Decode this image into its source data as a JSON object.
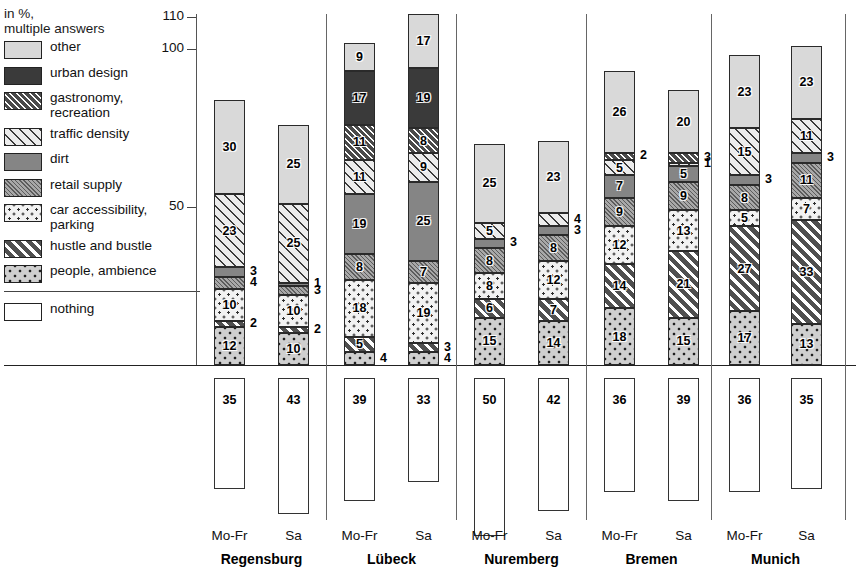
{
  "legend": {
    "title_line1": "in %,",
    "title_line2": "multiple answers",
    "items": [
      {
        "key": "other",
        "label": "other",
        "pattern": "p-other"
      },
      {
        "key": "urban",
        "label": "urban design",
        "pattern": "p-urban"
      },
      {
        "key": "gastro",
        "label": "gastronomy,\nrecreation",
        "pattern": "p-gastro"
      },
      {
        "key": "traffic",
        "label": "traffic density",
        "pattern": "p-traffic"
      },
      {
        "key": "dirt",
        "label": "dirt",
        "pattern": "p-dirt"
      },
      {
        "key": "retail",
        "label": "retail supply",
        "pattern": "p-retail"
      },
      {
        "key": "car",
        "label": "car accessibility,\nparking",
        "pattern": "p-car"
      },
      {
        "key": "hustle",
        "label": "hustle and bustle",
        "pattern": "p-hustle"
      },
      {
        "key": "people",
        "label": "people, ambience",
        "pattern": "p-people"
      }
    ],
    "nothing_label": "nothing",
    "nothing_pattern": "p-nothing"
  },
  "axis": {
    "ticks": [
      110,
      100,
      50
    ],
    "tick_labels": [
      "110",
      "100",
      "50"
    ]
  },
  "chart_data": {
    "type": "bar",
    "title": "",
    "subtitle": "in %, multiple answers",
    "xlabel": "",
    "ylabel": "in %",
    "ylim": [
      0,
      110
    ],
    "grid": false,
    "legend_position": "left",
    "stacked": true,
    "categories": [
      "Regensburg Mo-Fr",
      "Regensburg Sa",
      "Lübeck Mo-Fr",
      "Lübeck Sa",
      "Nuremberg Mo-Fr",
      "Nuremberg Sa",
      "Bremen Mo-Fr",
      "Bremen Sa",
      "Munich Mo-Fr",
      "Munich Sa"
    ],
    "series": [
      {
        "name": "people, ambience",
        "values": [
          12,
          10,
          4,
          4,
          15,
          14,
          18,
          15,
          17,
          13
        ]
      },
      {
        "name": "hustle and bustle",
        "values": [
          2,
          2,
          5,
          3,
          6,
          7,
          14,
          21,
          27,
          33
        ]
      },
      {
        "name": "car accessibility, parking",
        "values": [
          10,
          10,
          18,
          19,
          8,
          12,
          12,
          13,
          5,
          7
        ]
      },
      {
        "name": "retail supply",
        "values": [
          4,
          3,
          8,
          7,
          8,
          8,
          9,
          9,
          8,
          11
        ]
      },
      {
        "name": "dirt",
        "values": [
          3,
          1,
          19,
          25,
          3,
          3,
          7,
          5,
          3,
          3
        ]
      },
      {
        "name": "traffic density",
        "values": [
          23,
          25,
          11,
          9,
          5,
          4,
          5,
          1,
          15,
          11
        ]
      },
      {
        "name": "gastronomy, recreation",
        "values": [
          0,
          0,
          11,
          8,
          0,
          0,
          2,
          3,
          0,
          0
        ]
      },
      {
        "name": "urban design",
        "values": [
          0,
          0,
          17,
          19,
          0,
          0,
          0,
          0,
          0,
          0
        ]
      },
      {
        "name": "other",
        "values": [
          30,
          25,
          9,
          17,
          25,
          23,
          26,
          20,
          23,
          23
        ]
      }
    ],
    "nothing": {
      "name": "nothing",
      "values": [
        35,
        43,
        39,
        33,
        50,
        42,
        36,
        39,
        36,
        35
      ]
    }
  },
  "groups": [
    {
      "name": "Regensburg",
      "bars": [
        {
          "day": "Mo-Fr",
          "nothing": 35,
          "segments": [
            {
              "key": "people",
              "value": 12,
              "inside": true
            },
            {
              "key": "hustle",
              "value": 2,
              "inside": false
            },
            {
              "key": "car",
              "value": 10,
              "inside": true
            },
            {
              "key": "retail",
              "value": 4,
              "inside": false
            },
            {
              "key": "dirt",
              "value": 3,
              "inside": false
            },
            {
              "key": "traffic",
              "value": 23,
              "inside": true
            },
            {
              "key": "other",
              "value": 30,
              "inside": true
            }
          ]
        },
        {
          "day": "Sa",
          "nothing": 43,
          "segments": [
            {
              "key": "people",
              "value": 10,
              "inside": true
            },
            {
              "key": "hustle",
              "value": 2,
              "inside": false
            },
            {
              "key": "car",
              "value": 10,
              "inside": true
            },
            {
              "key": "retail",
              "value": 3,
              "inside": false
            },
            {
              "key": "dirt",
              "value": 1,
              "inside": false
            },
            {
              "key": "traffic",
              "value": 25,
              "inside": true
            },
            {
              "key": "other",
              "value": 25,
              "inside": true
            }
          ]
        }
      ]
    },
    {
      "name": "Lübeck",
      "bars": [
        {
          "day": "Mo-Fr",
          "nothing": 39,
          "segments": [
            {
              "key": "people",
              "value": 4,
              "inside": false
            },
            {
              "key": "hustle",
              "value": 5,
              "inside": true
            },
            {
              "key": "car",
              "value": 18,
              "inside": true
            },
            {
              "key": "retail",
              "value": 8,
              "inside": true
            },
            {
              "key": "dirt",
              "value": 19,
              "inside": true
            },
            {
              "key": "traffic",
              "value": 11,
              "inside": true
            },
            {
              "key": "gastro",
              "value": 11,
              "inside": true
            },
            {
              "key": "urban",
              "value": 17,
              "inside": true
            },
            {
              "key": "other",
              "value": 9,
              "inside": true
            }
          ]
        },
        {
          "day": "Sa",
          "nothing": 33,
          "segments": [
            {
              "key": "people",
              "value": 4,
              "inside": false
            },
            {
              "key": "hustle",
              "value": 3,
              "inside": false
            },
            {
              "key": "car",
              "value": 19,
              "inside": true
            },
            {
              "key": "retail",
              "value": 7,
              "inside": true
            },
            {
              "key": "dirt",
              "value": 25,
              "inside": true
            },
            {
              "key": "traffic",
              "value": 9,
              "inside": true
            },
            {
              "key": "gastro",
              "value": 8,
              "inside": true
            },
            {
              "key": "urban",
              "value": 19,
              "inside": true
            },
            {
              "key": "other",
              "value": 17,
              "inside": true
            }
          ]
        }
      ]
    },
    {
      "name": "Nuremberg",
      "bars": [
        {
          "day": "Mo-Fr",
          "nothing": 50,
          "segments": [
            {
              "key": "people",
              "value": 15,
              "inside": true
            },
            {
              "key": "hustle",
              "value": 6,
              "inside": true
            },
            {
              "key": "car",
              "value": 8,
              "inside": true
            },
            {
              "key": "retail",
              "value": 8,
              "inside": true
            },
            {
              "key": "dirt",
              "value": 3,
              "inside": false
            },
            {
              "key": "traffic",
              "value": 5,
              "inside": true
            },
            {
              "key": "other",
              "value": 25,
              "inside": true
            }
          ]
        },
        {
          "day": "Sa",
          "nothing": 42,
          "segments": [
            {
              "key": "people",
              "value": 14,
              "inside": true
            },
            {
              "key": "hustle",
              "value": 7,
              "inside": true
            },
            {
              "key": "car",
              "value": 12,
              "inside": true
            },
            {
              "key": "retail",
              "value": 8,
              "inside": true
            },
            {
              "key": "dirt",
              "value": 3,
              "inside": false
            },
            {
              "key": "traffic",
              "value": 4,
              "inside": false
            },
            {
              "key": "other",
              "value": 23,
              "inside": true
            }
          ]
        }
      ]
    },
    {
      "name": "Bremen",
      "bars": [
        {
          "day": "Mo-Fr",
          "nothing": 36,
          "segments": [
            {
              "key": "people",
              "value": 18,
              "inside": true
            },
            {
              "key": "hustle",
              "value": 14,
              "inside": true
            },
            {
              "key": "car",
              "value": 12,
              "inside": true
            },
            {
              "key": "retail",
              "value": 9,
              "inside": true
            },
            {
              "key": "dirt",
              "value": 7,
              "inside": true
            },
            {
              "key": "traffic",
              "value": 5,
              "inside": true
            },
            {
              "key": "gastro",
              "value": 2,
              "inside": false
            },
            {
              "key": "other",
              "value": 26,
              "inside": true
            }
          ]
        },
        {
          "day": "Sa",
          "nothing": 39,
          "segments": [
            {
              "key": "people",
              "value": 15,
              "inside": true
            },
            {
              "key": "hustle",
              "value": 21,
              "inside": true
            },
            {
              "key": "car",
              "value": 13,
              "inside": true
            },
            {
              "key": "retail",
              "value": 9,
              "inside": true
            },
            {
              "key": "dirt",
              "value": 5,
              "inside": true
            },
            {
              "key": "traffic",
              "value": 1,
              "inside": false
            },
            {
              "key": "gastro",
              "value": 3,
              "inside": false
            },
            {
              "key": "other",
              "value": 20,
              "inside": true
            }
          ]
        }
      ]
    },
    {
      "name": "Munich",
      "bars": [
        {
          "day": "Mo-Fr",
          "nothing": 36,
          "segments": [
            {
              "key": "people",
              "value": 17,
              "inside": true
            },
            {
              "key": "hustle",
              "value": 27,
              "inside": true
            },
            {
              "key": "car",
              "value": 5,
              "inside": true
            },
            {
              "key": "retail",
              "value": 8,
              "inside": true
            },
            {
              "key": "dirt",
              "value": 3,
              "inside": false
            },
            {
              "key": "traffic",
              "value": 15,
              "inside": true
            },
            {
              "key": "other",
              "value": 23,
              "inside": true
            }
          ]
        },
        {
          "day": "Sa",
          "nothing": 35,
          "segments": [
            {
              "key": "people",
              "value": 13,
              "inside": true
            },
            {
              "key": "hustle",
              "value": 33,
              "inside": true
            },
            {
              "key": "car",
              "value": 7,
              "inside": true
            },
            {
              "key": "retail",
              "value": 11,
              "inside": true
            },
            {
              "key": "dirt",
              "value": 3,
              "inside": false
            },
            {
              "key": "traffic",
              "value": 11,
              "inside": true
            },
            {
              "key": "other",
              "value": 23,
              "inside": true
            }
          ]
        }
      ]
    }
  ]
}
